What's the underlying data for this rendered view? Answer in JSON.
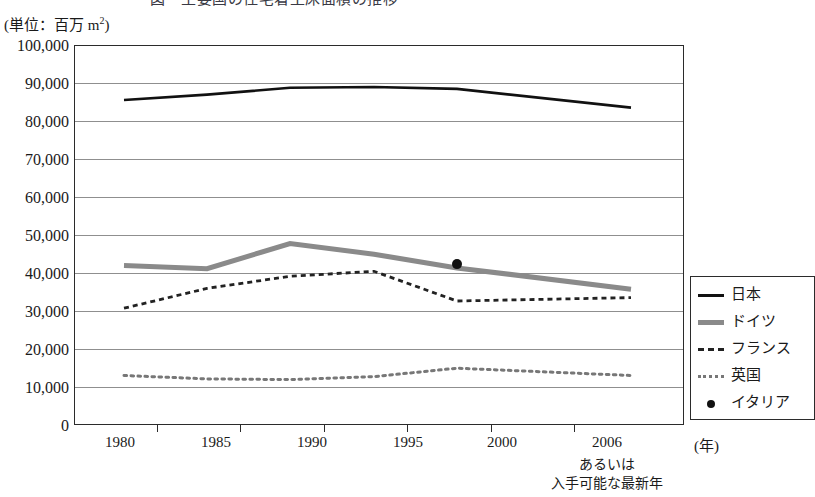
{
  "title_cut": "図　主要国の住宅着工床面積の推移",
  "unit_label": "(単位：百万 m",
  "unit_label_sup": "2",
  "unit_label_end": ")",
  "axis": {
    "x_unit": "(年)",
    "x_note_line1": "あるいは",
    "x_note_line2": "入手可能な最新年"
  },
  "legend": {
    "items": [
      {
        "label": "日本",
        "key": "solid-line-key",
        "color": "#111111"
      },
      {
        "label": "ドイツ",
        "key": "thick-gray-line-key",
        "color": "#8a8a8a"
      },
      {
        "label": "フランス",
        "key": "dashed-line-key",
        "color": "#222222"
      },
      {
        "label": "英国",
        "key": "dotted-line-key",
        "color": "#777777"
      },
      {
        "label": "イタリア",
        "key": "dot-marker-key",
        "color": "#111111"
      }
    ]
  },
  "chart_data": {
    "type": "line",
    "title": "図　主要国の住宅着工床面積の推移",
    "xlabel": "(年)",
    "ylabel": "(単位：百万 m2)",
    "categories": [
      "1980",
      "1985",
      "1990",
      "1995",
      "2000",
      "2006"
    ],
    "x": [
      1980,
      1985,
      1990,
      1995,
      2000,
      2006
    ],
    "xlim": [
      1978,
      2008
    ],
    "ylim": [
      0,
      100000
    ],
    "ytick_labels": [
      "0",
      "10,000",
      "20,000",
      "30,000",
      "40,000",
      "50,000",
      "60,000",
      "70,000",
      "80,000",
      "90,000",
      "100,000"
    ],
    "ytick_values": [
      0,
      10000,
      20000,
      30000,
      40000,
      50000,
      60000,
      70000,
      80000,
      90000,
      100000
    ],
    "grid": "horizontal",
    "legend_position": "right",
    "series": [
      {
        "name": "日本",
        "style": "solid",
        "color": "#111111",
        "values": [
          85800,
          87200,
          89000,
          89200,
          88700,
          83800
        ]
      },
      {
        "name": "ドイツ",
        "style": "thick-gray",
        "color": "#8a8a8a",
        "values": [
          42200,
          41400,
          48000,
          45200,
          41600,
          36000
        ]
      },
      {
        "name": "フランス",
        "style": "dashed",
        "color": "#222222",
        "values": [
          31000,
          36200,
          39400,
          40700,
          32900,
          33800
        ]
      },
      {
        "name": "英国",
        "style": "dotted",
        "color": "#777777",
        "values": [
          13300,
          12400,
          12200,
          13000,
          15200,
          13300
        ]
      },
      {
        "name": "イタリア",
        "style": "marker-only",
        "color": "#111111",
        "values": [
          null,
          null,
          null,
          null,
          42600,
          null
        ]
      }
    ]
  }
}
